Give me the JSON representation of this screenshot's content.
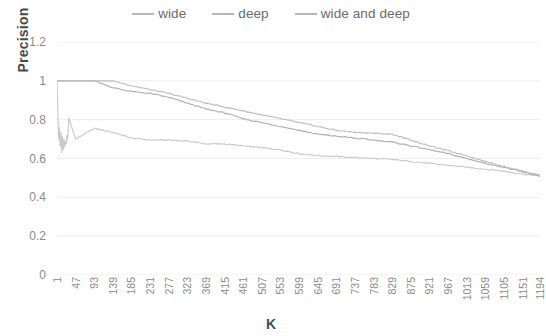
{
  "legend": {
    "position": "top-center",
    "items": [
      {
        "label": "wide",
        "color": "#c9c9c9"
      },
      {
        "label": "deep",
        "color": "#b0b0b0"
      },
      {
        "label": "wide and deep",
        "color": "#bdbdbd"
      }
    ]
  },
  "axes": {
    "ylabel": "Precision",
    "xlabel": "K",
    "yticks": [
      "0",
      "0.2",
      "0.4",
      "0.6",
      "0.8",
      "1",
      "1.2"
    ],
    "xticks": [
      "1",
      "47",
      "93",
      "139",
      "185",
      "231",
      "277",
      "323",
      "369",
      "415",
      "461",
      "507",
      "553",
      "599",
      "645",
      "691",
      "737",
      "783",
      "829",
      "875",
      "921",
      "967",
      "1013",
      "1059",
      "1105",
      "1151",
      "1194"
    ]
  },
  "chart_data": {
    "type": "line",
    "title": "",
    "subtitle": "",
    "xlabel": "K",
    "ylabel": "Precision",
    "xlim": [
      1,
      1194
    ],
    "ylim": [
      0,
      1.2
    ],
    "grid": true,
    "legend_position": "top-center",
    "x": [
      1,
      47,
      93,
      139,
      185,
      231,
      277,
      323,
      369,
      415,
      461,
      507,
      553,
      599,
      645,
      691,
      737,
      783,
      829,
      875,
      921,
      967,
      1013,
      1059,
      1105,
      1151,
      1194
    ],
    "series": [
      {
        "name": "wide",
        "color": "#c9c9c9",
        "values": [
          1.0,
          0.7,
          0.755,
          0.735,
          0.705,
          0.695,
          0.695,
          0.69,
          0.675,
          0.675,
          0.665,
          0.655,
          0.645,
          0.625,
          0.615,
          0.61,
          0.605,
          0.6,
          0.595,
          0.585,
          0.575,
          0.565,
          0.555,
          0.545,
          0.535,
          0.52,
          0.51
        ]
      },
      {
        "name": "deep",
        "color": "#b0b0b0",
        "values": [
          1.0,
          1.0,
          1.0,
          0.965,
          0.945,
          0.935,
          0.915,
          0.885,
          0.855,
          0.835,
          0.805,
          0.785,
          0.765,
          0.745,
          0.725,
          0.715,
          0.705,
          0.695,
          0.685,
          0.665,
          0.645,
          0.625,
          0.6,
          0.575,
          0.555,
          0.53,
          0.51
        ]
      },
      {
        "name": "wide and deep",
        "color": "#bdbdbd",
        "values": [
          1.0,
          1.0,
          1.0,
          1.0,
          0.975,
          0.955,
          0.935,
          0.91,
          0.885,
          0.865,
          0.845,
          0.825,
          0.805,
          0.785,
          0.765,
          0.745,
          0.735,
          0.73,
          0.725,
          0.695,
          0.665,
          0.64,
          0.615,
          0.585,
          0.56,
          0.535,
          0.515
        ]
      }
    ]
  }
}
